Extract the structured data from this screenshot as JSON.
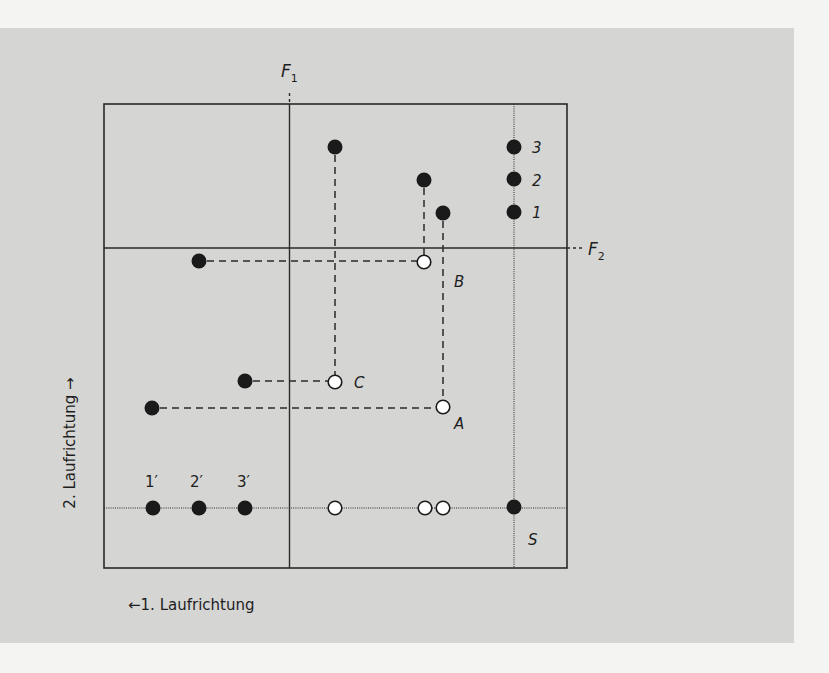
{
  "diagram": {
    "colors": {
      "page": "#f4f4f2",
      "panel": "#d5d5d3",
      "ink": "#1e1e1e",
      "open_point_fill": "#ffffff"
    },
    "axes": {
      "f1_label": "F",
      "f1_sub": "1",
      "f2_label": "F",
      "f2_sub": "2"
    },
    "directions": {
      "first": "←1. Laufrichtung",
      "second": "2. Laufrichtung →"
    },
    "right_column_labels": [
      "3",
      "2",
      "1"
    ],
    "bottom_row_labels": [
      "1′",
      "2′",
      "3′"
    ],
    "point_labels": {
      "A": "A",
      "B": "B",
      "C": "C",
      "S": "S"
    },
    "points": {
      "filled_top": [
        {
          "name": "C-first",
          "x": 335,
          "y": 147
        },
        {
          "name": "B-first",
          "x": 424,
          "y": 180
        },
        {
          "name": "A-first",
          "x": 443,
          "y": 213
        }
      ],
      "filled_left": [
        {
          "name": "B-second",
          "x": 199,
          "y": 261
        },
        {
          "name": "C-second",
          "x": 245,
          "y": 381
        },
        {
          "name": "A-second",
          "x": 152,
          "y": 408
        }
      ],
      "open": [
        {
          "name": "B",
          "x": 424,
          "y": 262
        },
        {
          "name": "C",
          "x": 335,
          "y": 382
        },
        {
          "name": "A",
          "x": 443,
          "y": 407
        }
      ],
      "right_column": [
        {
          "name": "3",
          "x": 514,
          "y": 147
        },
        {
          "name": "2",
          "x": 514,
          "y": 179
        },
        {
          "name": "1",
          "x": 514,
          "y": 212
        }
      ],
      "bottom_filled": [
        {
          "name": "1′",
          "x": 153,
          "y": 508
        },
        {
          "name": "2′",
          "x": 199,
          "y": 508
        },
        {
          "name": "3′",
          "x": 245,
          "y": 508
        }
      ],
      "bottom_open": [
        {
          "name": "C-proj",
          "x": 335,
          "y": 508
        },
        {
          "name": "B-proj",
          "x": 425,
          "y": 508
        },
        {
          "name": "A-proj",
          "x": 443,
          "y": 508
        }
      ],
      "S": {
        "x": 514,
        "y": 507
      }
    }
  }
}
